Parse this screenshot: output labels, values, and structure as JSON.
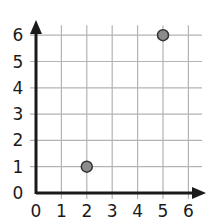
{
  "chart_data": {
    "type": "scatter",
    "title": "",
    "xlabel": "",
    "ylabel": "",
    "xlim": [
      0,
      6
    ],
    "ylim": [
      0,
      6
    ],
    "grid": true,
    "legend": null,
    "x_ticks": [
      "0",
      "1",
      "2",
      "3",
      "4",
      "5",
      "6"
    ],
    "y_ticks": [
      "0",
      "1",
      "2",
      "3",
      "4",
      "5",
      "6"
    ],
    "series": [
      {
        "name": "points",
        "points": [
          {
            "x": 2,
            "y": 1
          },
          {
            "x": 5,
            "y": 6
          }
        ]
      }
    ]
  },
  "colors": {
    "grid": "#b3b3b3",
    "axis": "#1a1a1a",
    "point_fill": "#8c8c8c",
    "point_stroke": "#333333"
  }
}
